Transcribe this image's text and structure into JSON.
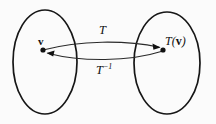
{
  "figure": {
    "type": "diagram",
    "background_color": "#fbfbfb",
    "ink_color": "#161616"
  },
  "labels": {
    "forward_map": "T",
    "inverse_map_base": "T",
    "inverse_map_exponent": "−1",
    "domain_vector": "v",
    "image_vector_function": "T",
    "image_vector_open": "(",
    "image_vector_arg": "v",
    "image_vector_close": ")"
  },
  "shapes": {
    "domain_set": {
      "name": "left-set-ellipse",
      "cx": 45,
      "cy": 62,
      "rx": 32,
      "ry": 52
    },
    "codomain_set": {
      "name": "right-set-ellipse",
      "cx": 167,
      "cy": 63,
      "rx": 33,
      "ry": 51
    }
  },
  "points": [
    {
      "name": "domain-vector-dot",
      "x": 43,
      "y": 50
    },
    {
      "name": "image-vector-dot",
      "x": 163,
      "y": 50
    }
  ],
  "arrows": [
    {
      "name": "forward-arrow",
      "label": "T",
      "from_x": 43,
      "from_y": 50,
      "to_x": 159,
      "to_y": 47,
      "bow": "up"
    },
    {
      "name": "inverse-arrow",
      "label": "T−1",
      "from_x": 163,
      "from_y": 51,
      "to_x": 47,
      "to_y": 53,
      "bow": "down"
    }
  ]
}
